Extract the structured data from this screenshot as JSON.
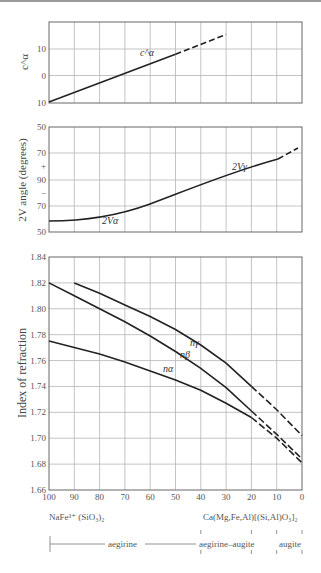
{
  "chart_data": [
    {
      "type": "line",
      "title": "",
      "ylabel": "c^α",
      "xlabel": "",
      "x_ticks": [
        "100",
        "90",
        "80",
        "70",
        "60",
        "50",
        "40",
        "30",
        "20",
        "10",
        "0"
      ],
      "y_ticks": [
        "10",
        "0",
        "10"
      ],
      "ylim": [
        -10,
        20
      ],
      "series": [
        {
          "name": "c^α",
          "style": "solid",
          "x": [
            100,
            50
          ],
          "y": [
            -10,
            8
          ]
        },
        {
          "name": "c^α (extrapolated)",
          "style": "dashed",
          "x": [
            50,
            30
          ],
          "y": [
            8,
            15.5
          ]
        }
      ],
      "annotations": [
        "c^α"
      ]
    },
    {
      "type": "line",
      "title": "",
      "ylabel": "2V angle (degrees)",
      "y_ticks": [
        "50",
        "70",
        "+",
        "90",
        "−",
        "70",
        "50"
      ],
      "series": [
        {
          "name": "2Vα",
          "style": "solid",
          "x": [
            100,
            90,
            80,
            70,
            60,
            50,
            40,
            30
          ],
          "y_label_positions": [
            "-62",
            "-64",
            "-67",
            "-72",
            "-78",
            "-86",
            "+85",
            "+77"
          ]
        },
        {
          "name": "2Vγ",
          "style": "dashed",
          "x": [
            30,
            15
          ],
          "y_label_positions": [
            "+77",
            "+72"
          ]
        }
      ],
      "annotations": [
        "2Vα",
        "2Vγ"
      ]
    },
    {
      "type": "line",
      "title": "",
      "ylabel": "Index of refraction",
      "xlabel": "",
      "x_ticks": [
        "100",
        "90",
        "80",
        "70",
        "60",
        "50",
        "40",
        "30",
        "20",
        "10",
        "0"
      ],
      "y_ticks": [
        "1.84",
        "1.82",
        "1.80",
        "1.78",
        "1.76",
        "1.74",
        "1.72",
        "1.70",
        "1.68",
        "1.66"
      ],
      "ylim": [
        1.66,
        1.84
      ],
      "grid": true,
      "series": [
        {
          "name": "nγ",
          "x": [
            90,
            80,
            70,
            60,
            50,
            40,
            30,
            20,
            10,
            0
          ],
          "y": [
            1.82,
            1.812,
            1.803,
            1.794,
            1.784,
            1.772,
            1.758,
            1.74,
            1.722,
            1.702
          ],
          "dashed_from": 20
        },
        {
          "name": "nβ",
          "x": [
            100,
            90,
            80,
            70,
            60,
            50,
            40,
            30,
            20,
            10,
            0
          ],
          "y": [
            1.82,
            1.81,
            1.8,
            1.79,
            1.779,
            1.767,
            1.754,
            1.739,
            1.721,
            1.703,
            1.684
          ],
          "dashed_from": 20
        },
        {
          "name": "nα",
          "x": [
            100,
            90,
            80,
            70,
            60,
            50,
            40,
            30,
            20,
            10,
            0
          ],
          "y": [
            1.775,
            1.77,
            1.765,
            1.759,
            1.752,
            1.745,
            1.737,
            1.727,
            1.716,
            1.7,
            1.681
          ],
          "dashed_from": 20
        }
      ],
      "annotations": [
        "nγ",
        "nβ",
        "nα"
      ]
    }
  ],
  "labels": {
    "left_formula": "NaFe³⁺ (SiO₃)₂",
    "right_formula": "Ca(Mg,Fe,Al)[(Si,Al)O₃]₂",
    "range_aegirine": "aegirine",
    "range_aegirine_augite": "aegirine–augite",
    "range_augite": "augite",
    "top_ylabel": "c^α",
    "top_curve": "c^α",
    "mid_ylabel": "2V angle (degrees)",
    "mid_curve_a": "2Vα",
    "mid_curve_g": "2Vγ",
    "bot_ylabel": "Index of refraction",
    "n_gamma": "nγ",
    "n_beta": "nβ",
    "n_alpha": "nα"
  },
  "ticks": {
    "x": [
      "100",
      "90",
      "80",
      "70",
      "60",
      "50",
      "40",
      "30",
      "20",
      "10",
      "0"
    ],
    "top_y": [
      "10",
      "0",
      "10"
    ],
    "mid_y": [
      "50",
      "70",
      "+",
      "90",
      "−",
      "70",
      "50"
    ],
    "bot_y": [
      "1.84",
      "1.82",
      "1.80",
      "1.78",
      "1.76",
      "1.74",
      "1.72",
      "1.70",
      "1.68",
      "1.66"
    ]
  }
}
